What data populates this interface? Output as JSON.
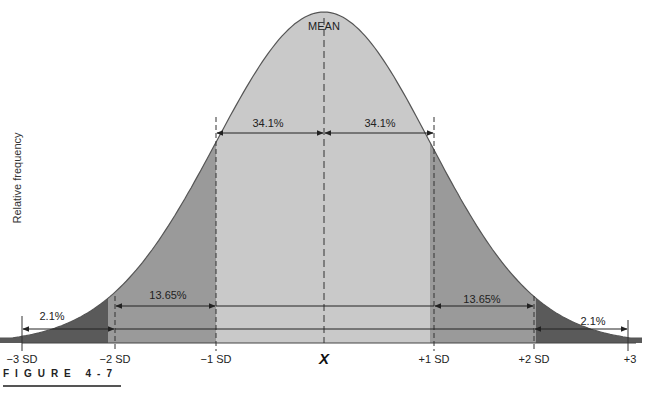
{
  "figure": {
    "caption": "FIGURE 4-7",
    "ylabel": "Relative frequency",
    "mean_label": "MEAN",
    "mean_symbol": "X̄"
  },
  "colors": {
    "curve": "#555555",
    "band_1sd": "#c9c9c9",
    "band_2sd": "#9a9a9a",
    "band_3sd": "#5a5a5a",
    "lines": "#222222",
    "background": "#ffffff"
  },
  "chart_data": {
    "type": "area",
    "xlabel": "",
    "ylabel": "Relative frequency",
    "x_ticks": [
      "−3 SD",
      "−2 SD",
      "−1 SD",
      "X̄",
      "+1 SD",
      "+2 SD",
      "+3"
    ],
    "x_values": [
      -3,
      -2,
      -1,
      0,
      1,
      2,
      3
    ],
    "regions": [
      {
        "from": -3,
        "to": -2,
        "percent": "2.1%",
        "shade": "dark"
      },
      {
        "from": -2,
        "to": -1,
        "percent": "13.65%",
        "shade": "medium"
      },
      {
        "from": -1,
        "to": 0,
        "percent": "34.1%",
        "shade": "light"
      },
      {
        "from": 0,
        "to": 1,
        "percent": "34.1%",
        "shade": "light"
      },
      {
        "from": 1,
        "to": 2,
        "percent": "13.65%",
        "shade": "medium"
      },
      {
        "from": 2,
        "to": 3,
        "percent": "2.1%",
        "shade": "dark"
      }
    ],
    "annotations": [
      "MEAN",
      "34.1%",
      "34.1%",
      "13.65%",
      "13.65%",
      "2.1%",
      "2.1%"
    ],
    "grid": false,
    "legend": null
  },
  "labels": {
    "pct_1sd_left": "34.1%",
    "pct_1sd_right": "34.1%",
    "pct_2sd_left": "13.65%",
    "pct_2sd_right": "13.65%",
    "pct_3sd_left": "2.1%",
    "pct_3sd_right": "2.1%",
    "tick_m3": "−3 SD",
    "tick_m2": "−2 SD",
    "tick_m1": "−1 SD",
    "tick_0": "X",
    "tick_p1": "+1 SD",
    "tick_p2": "+2 SD",
    "tick_p3": "+3"
  }
}
